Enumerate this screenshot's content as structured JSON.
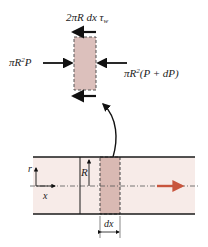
{
  "labels": {
    "shear_force": "2πR dx τ",
    "shear_sub": "w",
    "pressure_left_pre": "πR",
    "pressure_left_exp": "2",
    "pressure_left_post": "P",
    "pressure_right_pre": "πR",
    "pressure_right_exp": "2",
    "pressure_right_post": "(P + dP)",
    "radius_axis": "r",
    "axial_axis": "x",
    "radius": "R",
    "element_length": "dx"
  },
  "colors": {
    "element_fill": "#dcc0bc",
    "pipe_fill": "#f7ebe8",
    "element_in_pipe_fill": "#d9b9b3",
    "flow_arrow": "#c8553d",
    "line": "#1a1a1a"
  }
}
